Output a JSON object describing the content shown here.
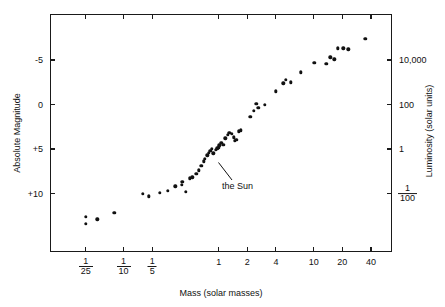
{
  "chart_data": {
    "type": "scatter",
    "title": "",
    "xlabel": "Mass (solar masses)",
    "ylabel": "Absolute Magnitude",
    "y2label": "Luminosity (solar units)",
    "x_scale": "log",
    "y_scale": "linear-magnitude-inverted",
    "xlim": [
      0.026,
      57
    ],
    "ylim": [
      -8.2,
      13.2
    ],
    "grid": false,
    "legend": null,
    "xticks": [
      {
        "value": 0.04,
        "label": "1/25",
        "num": "1",
        "den": "25"
      },
      {
        "value": 0.1,
        "label": "1/10",
        "num": "1",
        "den": "10"
      },
      {
        "value": 0.2,
        "label": "1/5",
        "num": "1",
        "den": "5"
      },
      {
        "value": 1,
        "label": "1"
      },
      {
        "value": 2,
        "label": "2"
      },
      {
        "value": 4,
        "label": "4"
      },
      {
        "value": 10,
        "label": "10"
      },
      {
        "value": 20,
        "label": "20"
      },
      {
        "value": 40,
        "label": "40"
      }
    ],
    "yticks": [
      {
        "value": -5,
        "label": "-5"
      },
      {
        "value": 0,
        "label": "0"
      },
      {
        "value": 5,
        "label": "+5"
      },
      {
        "value": 10,
        "label": "+10"
      }
    ],
    "y2ticks": [
      {
        "magnitude": -5,
        "label": "10,000"
      },
      {
        "magnitude": 0,
        "label": "100"
      },
      {
        "magnitude": 5,
        "label": "1"
      },
      {
        "magnitude": 10,
        "label": "1/100",
        "num": "1",
        "den": "100"
      }
    ],
    "annotations": [
      {
        "text": "the Sun",
        "point_mass": 1.0,
        "point_magnitude": 4.8,
        "label_x": 222,
        "label_y": 181,
        "leader_from": [
          232,
          180
        ],
        "leader_to": [
          218.5,
          162.5
        ]
      }
    ],
    "points": [
      {
        "mass": 0.04,
        "mag": 12.6
      },
      {
        "mass": 0.04,
        "mag": 13.4
      },
      {
        "mass": 0.053,
        "mag": 12.9
      },
      {
        "mass": 0.08,
        "mag": 12.2
      },
      {
        "mass": 0.16,
        "mag": 10.0
      },
      {
        "mass": 0.185,
        "mag": 10.3
      },
      {
        "mass": 0.24,
        "mag": 9.9
      },
      {
        "mass": 0.29,
        "mag": 9.7
      },
      {
        "mass": 0.35,
        "mag": 9.2
      },
      {
        "mass": 0.41,
        "mag": 9.0
      },
      {
        "mass": 0.415,
        "mag": 8.7
      },
      {
        "mass": 0.45,
        "mag": 9.8
      },
      {
        "mass": 0.5,
        "mag": 8.3
      },
      {
        "mass": 0.53,
        "mag": 8.2
      },
      {
        "mass": 0.58,
        "mag": 7.8
      },
      {
        "mass": 0.62,
        "mag": 7.4
      },
      {
        "mass": 0.66,
        "mag": 6.9
      },
      {
        "mass": 0.7,
        "mag": 6.4
      },
      {
        "mass": 0.72,
        "mag": 6.1
      },
      {
        "mass": 0.76,
        "mag": 5.7
      },
      {
        "mass": 0.79,
        "mag": 5.4
      },
      {
        "mass": 0.82,
        "mag": 5.2
      },
      {
        "mass": 0.85,
        "mag": 5.0
      },
      {
        "mass": 0.88,
        "mag": 5.5
      },
      {
        "mass": 0.93,
        "mag": 5.1
      },
      {
        "mass": 0.97,
        "mag": 4.9
      },
      {
        "mass": 1.0,
        "mag": 4.8
      },
      {
        "mass": 1.02,
        "mag": 4.6
      },
      {
        "mass": 1.07,
        "mag": 4.3
      },
      {
        "mass": 1.12,
        "mag": 4.5
      },
      {
        "mass": 1.18,
        "mag": 3.8
      },
      {
        "mass": 1.24,
        "mag": 3.4
      },
      {
        "mass": 1.3,
        "mag": 3.2
      },
      {
        "mass": 1.38,
        "mag": 3.3
      },
      {
        "mass": 1.44,
        "mag": 3.7
      },
      {
        "mass": 1.48,
        "mag": 4.1
      },
      {
        "mass": 1.54,
        "mag": 4.0
      },
      {
        "mass": 1.62,
        "mag": 3.0
      },
      {
        "mass": 1.7,
        "mag": 2.9
      },
      {
        "mass": 2.15,
        "mag": 1.4
      },
      {
        "mass": 2.35,
        "mag": 0.7
      },
      {
        "mass": 2.5,
        "mag": -0.1
      },
      {
        "mass": 2.6,
        "mag": 0.4
      },
      {
        "mass": 3.05,
        "mag": 0.0
      },
      {
        "mass": 4.0,
        "mag": -1.5
      },
      {
        "mass": 4.8,
        "mag": -2.4
      },
      {
        "mass": 5.1,
        "mag": -2.8
      },
      {
        "mass": 5.7,
        "mag": -2.5
      },
      {
        "mass": 7.3,
        "mag": -3.6
      },
      {
        "mass": 10.1,
        "mag": -4.7
      },
      {
        "mass": 13.5,
        "mag": -4.6
      },
      {
        "mass": 15.0,
        "mag": -5.3
      },
      {
        "mass": 16.5,
        "mag": -5.1
      },
      {
        "mass": 18.0,
        "mag": -6.3
      },
      {
        "mass": 20.5,
        "mag": -6.3
      },
      {
        "mass": 23.0,
        "mag": -6.2
      },
      {
        "mass": 35.0,
        "mag": -7.4
      }
    ]
  },
  "icons": {
    "leader_line": "annotation-leader-line"
  }
}
